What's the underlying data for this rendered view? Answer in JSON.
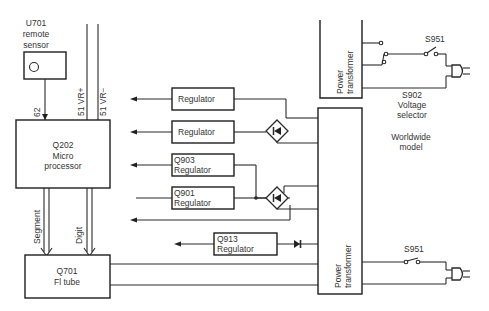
{
  "diagram": {
    "sensor": {
      "line1": "U701",
      "line2": "remote",
      "line3": "sensor",
      "signal": "62"
    },
    "rails": {
      "plus": "51 VR+",
      "minus": "51 VR−"
    },
    "micro": {
      "line1": "Q202",
      "line2": "Micro",
      "line3": "processor"
    },
    "buses": {
      "segment": "Segment",
      "digit": "Digit"
    },
    "fl_tube": {
      "line1": "Q701",
      "line2": "Fl tube"
    },
    "regulators": [
      {
        "line1": "Regulator",
        "line2": ""
      },
      {
        "line1": "Regulator",
        "line2": ""
      },
      {
        "line1": "Q903",
        "line2": "Regulator"
      },
      {
        "line1": "Q901",
        "line2": "Regulator"
      },
      {
        "line1": "Q913",
        "line2": "Regulator"
      }
    ],
    "transformer_top": {
      "line1": "Power",
      "line2": "transformer"
    },
    "transformer_bottom": {
      "line1": "Power",
      "line2": "transformer"
    },
    "switch_top": "S951",
    "selector": {
      "line1": "S902",
      "line2": "Voltage",
      "line3": "selector"
    },
    "worldwide": {
      "line1": "Worldwide",
      "line2": "model"
    },
    "switch_bottom": "S951"
  }
}
